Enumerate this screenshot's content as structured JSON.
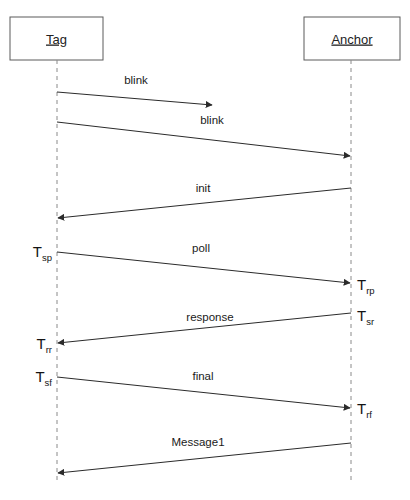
{
  "diagram": {
    "type": "sequence-diagram",
    "canvas": {
      "width": 410,
      "height": 500,
      "background": "#ffffff"
    },
    "colors": {
      "box_stroke": "#5a5a5a",
      "box_fill": "#ffffff",
      "lifeline": "#8a8a8a",
      "message_line": "#2b2b2b",
      "text": "#1a1a1a"
    },
    "actors": [
      {
        "id": "tag",
        "label": "Tag",
        "box": {
          "x": 10,
          "y": 17,
          "width": 93,
          "height": 43
        },
        "lifeline_x": 57,
        "lifeline_top": 60,
        "lifeline_bottom": 484
      },
      {
        "id": "anchor",
        "label": "Anchor",
        "box": {
          "x": 304,
          "y": 17,
          "width": 96,
          "height": 43
        },
        "lifeline_x": 351,
        "lifeline_top": 60,
        "lifeline_bottom": 484
      }
    ],
    "messages": [
      {
        "id": "blink-1",
        "label": "blink",
        "from": "tag",
        "to": "anchor",
        "direction": "right",
        "truncated": true,
        "x1": 57,
        "y1": 92,
        "x2": 212,
        "y2": 105,
        "label_x": 136,
        "label_y": 84
      },
      {
        "id": "blink-2",
        "label": "blink",
        "from": "tag",
        "to": "anchor",
        "direction": "right",
        "truncated": false,
        "x1": 57,
        "y1": 122,
        "x2": 350,
        "y2": 156,
        "label_x": 212,
        "label_y": 124
      },
      {
        "id": "init",
        "label": "init",
        "from": "anchor",
        "to": "tag",
        "direction": "left",
        "truncated": false,
        "x1": 351,
        "y1": 188,
        "x2": 58,
        "y2": 218,
        "label_x": 203,
        "label_y": 192
      },
      {
        "id": "poll",
        "label": "poll",
        "from": "tag",
        "to": "anchor",
        "direction": "right",
        "truncated": false,
        "x1": 57,
        "y1": 252,
        "x2": 350,
        "y2": 283,
        "label_x": 201,
        "label_y": 252
      },
      {
        "id": "response",
        "label": "response",
        "from": "anchor",
        "to": "tag",
        "direction": "left",
        "truncated": false,
        "x1": 351,
        "y1": 313,
        "x2": 58,
        "y2": 343,
        "label_x": 210,
        "label_y": 321
      },
      {
        "id": "final",
        "label": "final",
        "from": "tag",
        "to": "anchor",
        "direction": "right",
        "truncated": false,
        "x1": 57,
        "y1": 377,
        "x2": 350,
        "y2": 408,
        "label_x": 203,
        "label_y": 380
      },
      {
        "id": "message1",
        "label": "Message1",
        "from": "anchor",
        "to": "tag",
        "direction": "left",
        "truncated": false,
        "x1": 351,
        "y1": 443,
        "x2": 58,
        "y2": 473,
        "label_x": 198,
        "label_y": 446
      }
    ],
    "timestamps": [
      {
        "id": "t-sp",
        "base": "T",
        "sub": "sp",
        "side": "left",
        "x": 52,
        "y": 257
      },
      {
        "id": "t-rp",
        "base": "T",
        "sub": "rp",
        "side": "right",
        "x": 357,
        "y": 290
      },
      {
        "id": "t-sr",
        "base": "T",
        "sub": "sr",
        "side": "right",
        "x": 357,
        "y": 321
      },
      {
        "id": "t-rr",
        "base": "T",
        "sub": "rr",
        "side": "left",
        "x": 52,
        "y": 349
      },
      {
        "id": "t-sf",
        "base": "T",
        "sub": "sf",
        "side": "left",
        "x": 52,
        "y": 382
      },
      {
        "id": "t-rf",
        "base": "T",
        "sub": "rf",
        "side": "right",
        "x": 357,
        "y": 414
      }
    ]
  }
}
